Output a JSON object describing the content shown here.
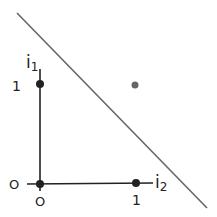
{
  "diagram": {
    "axes": {
      "vertical_label": "i",
      "vertical_subscript": "1",
      "horizontal_label": "i",
      "horizontal_subscript": "2"
    },
    "tick_labels": {
      "y_one": "1",
      "y_zero": "O",
      "x_zero": "O",
      "x_one": "1"
    },
    "points": [
      {
        "name": "point-0-1",
        "x": 0,
        "y": 1,
        "color": "#222222"
      },
      {
        "name": "point-0-0",
        "x": 0,
        "y": 0,
        "color": "#222222"
      },
      {
        "name": "point-1-0",
        "x": 1,
        "y": 0,
        "color": "#222222"
      },
      {
        "name": "point-1-1",
        "x": 1,
        "y": 1,
        "color": "#666666"
      }
    ],
    "separating_line": {
      "color": "#666666"
    }
  }
}
